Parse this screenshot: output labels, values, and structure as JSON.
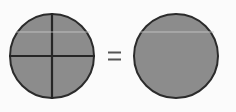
{
  "figure": {
    "description": "A gray circle divided into four equal quadrants by a vertical and a horizontal diameter, an equals sign, and an identical undivided gray circle.",
    "background_color": "#fbfbfb",
    "canvas": {
      "width": 236,
      "height": 112
    }
  },
  "colors": {
    "circle_fill": "#8c8c8c",
    "circle_stroke": "#2b2b2b",
    "divider_line": "#262626",
    "equals_sign": "#555555",
    "highlight_streak": "#c8c8c8",
    "background": "#fbfbfb"
  },
  "shapes": {
    "left_circle": {
      "label": "divided-circle",
      "center_x": 52,
      "center_y": 56,
      "radius": 43,
      "fill": "#8c8c8c",
      "stroke": "#2b2b2b",
      "stroke_width": 2,
      "divisions": 4,
      "division_label": "four quadrants"
    },
    "right_circle": {
      "label": "whole-circle",
      "center_x": 176,
      "center_y": 56,
      "radius": 43,
      "fill": "#8c8c8c",
      "stroke": "#2b2b2b",
      "stroke_width": 2,
      "divisions": 1,
      "division_label": "whole"
    },
    "dividers": [
      {
        "name": "vertical-diameter",
        "x1": 52,
        "y1": 13,
        "x2": 52,
        "y2": 99,
        "width": 2.2
      },
      {
        "name": "horizontal-diameter",
        "x1": 9,
        "y1": 56,
        "x2": 95,
        "y2": 56,
        "width": 2.2
      }
    ],
    "equals": {
      "label": "equals-sign",
      "symbol": "=",
      "x": 108,
      "y": 56,
      "bar_width": 13,
      "bar_height": 2,
      "bar_gap": 5
    },
    "streaks": [
      {
        "name": "left-circle-streak",
        "x1": 16,
        "y1": 32,
        "x2": 90,
        "y2": 32
      },
      {
        "name": "right-circle-streak",
        "x1": 140,
        "y1": 32,
        "x2": 214,
        "y2": 32
      }
    ]
  }
}
